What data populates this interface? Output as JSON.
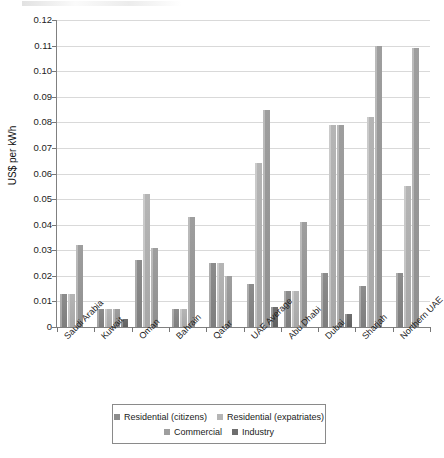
{
  "chart_data": {
    "type": "bar",
    "title": "",
    "xlabel": "",
    "ylabel": "US$ per kWh",
    "ylim": [
      0,
      0.12
    ],
    "ytick_values": [
      0,
      0.01,
      0.02,
      0.03,
      0.04,
      0.05,
      0.06,
      0.07,
      0.08,
      0.09,
      0.1,
      0.11,
      0.12
    ],
    "ytick_labels": [
      "0",
      "0.01",
      "0.02",
      "0.03",
      "0.04",
      "0.05",
      "0.06",
      "0.07",
      "0.08",
      "0.09",
      "0.10",
      "0.11",
      "0.12"
    ],
    "grid": true,
    "legend_position": "bottom",
    "categories": [
      "Saudi Arabia",
      "Kuwait",
      "Oman",
      "Bahrain",
      "Qatar",
      "UAE Average",
      "Abu Dhabi",
      "Dubai",
      "Sharjah",
      "Northern UAE"
    ],
    "series": [
      {
        "name": "Residential (citizens)",
        "color": "#8c8c8c",
        "values": [
          0.013,
          0.007,
          0.026,
          0.007,
          0.025,
          0.017,
          0.014,
          0.021,
          0.016,
          0.021
        ]
      },
      {
        "name": "Residential (expatriates)",
        "color": "#b5b5b5",
        "values": [
          0.013,
          0.007,
          0.052,
          0.007,
          0.025,
          0.064,
          0.014,
          0.079,
          0.082,
          0.055
        ]
      },
      {
        "name": "Commercial",
        "color": "#9e9e9e",
        "values": [
          0.032,
          0.007,
          0.031,
          0.043,
          0.02,
          0.085,
          0.041,
          0.079,
          0.11,
          0.109
        ]
      },
      {
        "name": "Industry",
        "color": "#6e6e6e",
        "values": [
          0.0,
          0.003,
          0.0,
          0.0,
          0.0,
          0.008,
          0.0,
          0.005,
          0.0,
          0.0
        ]
      }
    ]
  },
  "legend": {
    "items": [
      {
        "label": "Residential (citizens)",
        "color": "#8c8c8c"
      },
      {
        "label": "Residential (expatriates)",
        "color": "#b5b5b5"
      },
      {
        "label": "Commercial",
        "color": "#9e9e9e"
      },
      {
        "label": "Industry",
        "color": "#6e6e6e"
      }
    ]
  }
}
